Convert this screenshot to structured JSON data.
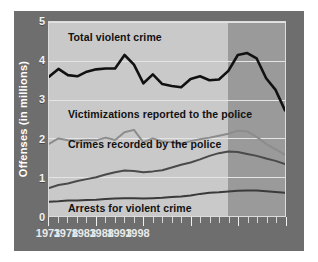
{
  "chart_data": {
    "type": "line",
    "title": "",
    "xlabel": "",
    "ylabel": "Offenses (in millions)",
    "xlim": [
      1973,
      1998
    ],
    "ylim": [
      0,
      5
    ],
    "yticks": [
      0,
      1,
      2,
      3,
      4,
      5
    ],
    "xticks": [
      1973,
      1978,
      1983,
      1988,
      1993,
      1998
    ],
    "grid": true,
    "legend": "inline-labels",
    "shaded_region": {
      "start": 1992,
      "end": 1998,
      "color": "#9a9a9a"
    },
    "x": [
      1973,
      1974,
      1975,
      1976,
      1977,
      1978,
      1979,
      1980,
      1981,
      1982,
      1983,
      1984,
      1985,
      1986,
      1987,
      1988,
      1989,
      1990,
      1991,
      1992,
      1993,
      1994,
      1995,
      1996,
      1997,
      1998
    ],
    "series": [
      {
        "name": "Total violent crime",
        "color": "#111111",
        "values": [
          3.59,
          3.79,
          3.63,
          3.6,
          3.72,
          3.78,
          3.8,
          3.8,
          4.15,
          3.9,
          3.42,
          3.65,
          3.4,
          3.35,
          3.32,
          3.53,
          3.6,
          3.5,
          3.52,
          3.74,
          4.15,
          4.2,
          4.06,
          3.55,
          3.25,
          2.72
        ]
      },
      {
        "name": "Victimizations reported to the police",
        "color": "#8c8c8c",
        "values": [
          1.86,
          2.0,
          1.95,
          1.94,
          1.96,
          1.95,
          2.02,
          1.96,
          2.16,
          2.22,
          1.9,
          2.0,
          1.92,
          1.9,
          1.86,
          1.93,
          1.98,
          2.02,
          2.07,
          2.12,
          2.2,
          2.18,
          2.04,
          1.86,
          1.72,
          1.58
        ]
      },
      {
        "name": "Crimes recorded by the police",
        "color": "#4a4a4a",
        "values": [
          0.72,
          0.8,
          0.84,
          0.9,
          0.95,
          1.0,
          1.07,
          1.13,
          1.17,
          1.16,
          1.13,
          1.15,
          1.18,
          1.25,
          1.32,
          1.38,
          1.46,
          1.55,
          1.62,
          1.66,
          1.65,
          1.6,
          1.55,
          1.48,
          1.42,
          1.34
        ]
      },
      {
        "name": "Arrests for violent crime",
        "color": "#3a3a3a",
        "values": [
          0.37,
          0.38,
          0.4,
          0.4,
          0.41,
          0.42,
          0.44,
          0.45,
          0.46,
          0.46,
          0.45,
          0.46,
          0.47,
          0.49,
          0.5,
          0.53,
          0.57,
          0.6,
          0.61,
          0.63,
          0.65,
          0.66,
          0.66,
          0.64,
          0.62,
          0.6
        ]
      }
    ],
    "annotations": [
      {
        "text": "Total violent crime",
        "x": 1975.0,
        "y": 4.62
      },
      {
        "text": "Victimizations reported to the police",
        "x": 1975.0,
        "y": 2.62
      },
      {
        "text": "Crimes recorded by the police",
        "x": 1975.0,
        "y": 1.85
      },
      {
        "text": "Arrests for violent crime",
        "x": 1975.0,
        "y": 0.2
      }
    ]
  }
}
